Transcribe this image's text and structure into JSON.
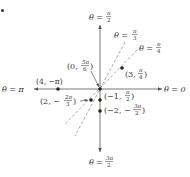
{
  "diagram": {
    "type": "polar-coordinate-plot",
    "origin_px": [
      100,
      89
    ],
    "scale_px_per_unit": 10.5,
    "corner_mark": "•",
    "axes": {
      "theta_0": "θ = 0",
      "theta_pi": "θ = π",
      "theta_pi_2": {
        "lhs": "θ =",
        "num": "π",
        "den": "2"
      },
      "theta_3pi_2": {
        "lhs": "θ =",
        "num": "3π",
        "den": "2"
      }
    },
    "rays": [
      {
        "angle_label": {
          "lhs": "θ =",
          "num": "π",
          "den": "3"
        },
        "angle_deg": 60,
        "style": "dashed"
      },
      {
        "angle_label": {
          "lhs": "θ =",
          "num": "π",
          "den": "4"
        },
        "angle_deg": 45,
        "style": "dashed"
      }
    ],
    "points": [
      {
        "r": 0,
        "theta": "5π/6",
        "label_prefix": "(0,",
        "num": "5π",
        "den": "6",
        "label_suffix": ")"
      },
      {
        "r": 3,
        "theta": "π/4",
        "label_prefix": "(3,",
        "num": "π",
        "den": "4",
        "label_suffix": ")"
      },
      {
        "r": 4,
        "theta": "−π",
        "label": "(4, −π)"
      },
      {
        "r": 2,
        "theta": "−2π/3",
        "label_prefix": "(2, −",
        "num": "2π",
        "den": "3",
        "label_suffix": ")"
      },
      {
        "r": -1,
        "theta": "π/2",
        "label_prefix": "(−1,",
        "num": "π",
        "den": "2",
        "label_suffix": ")"
      },
      {
        "r": -2,
        "theta": "−3π/2",
        "label_prefix": "(−2, −",
        "num": "3π",
        "den": "2",
        "label_suffix": ")"
      }
    ]
  }
}
